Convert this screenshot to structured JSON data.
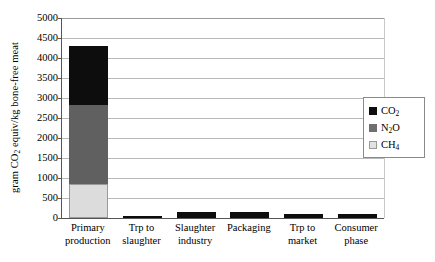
{
  "chart_data": {
    "type": "bar",
    "subtype": "stacked",
    "title": "",
    "xlabel": "",
    "ylabel": "gram CO2 equiv/kg bone-free meat",
    "ylabel_parts": {
      "pre": "gram CO",
      "sub": "2",
      "post": " equiv/kg bone-free meat"
    },
    "ylim": [
      0,
      5000
    ],
    "ytick_step": 500,
    "ytick_labels": [
      "0",
      "500",
      "1000",
      "1500",
      "2000",
      "2500",
      "3000",
      "3500",
      "4000",
      "4500",
      "5000"
    ],
    "ytick_values": [
      0,
      500,
      1000,
      1500,
      2000,
      2500,
      3000,
      3500,
      4000,
      4500,
      5000
    ],
    "grid": true,
    "grid_axis": "y",
    "legend_position": "right",
    "categories": [
      "Primary production",
      "Trp to slaughter",
      "Slaughter industry",
      "Packaging",
      "Trp to market",
      "Consumer phase"
    ],
    "category_lines": [
      [
        "Primary",
        "production"
      ],
      [
        "Trp to",
        "slaughter"
      ],
      [
        "Slaughter",
        "industry"
      ],
      [
        "Packaging",
        ""
      ],
      [
        "Trp to",
        "market"
      ],
      [
        "Consumer",
        "phase"
      ]
    ],
    "series": [
      {
        "name": "CH4",
        "name_parts": {
          "pre": "CH",
          "sub": "4"
        },
        "color": "#dcdcdc",
        "values": [
          850,
          0,
          0,
          0,
          0,
          0
        ]
      },
      {
        "name": "N2O",
        "name_parts": {
          "pre": "N",
          "sub": "2",
          "post": "O"
        },
        "color": "#606060",
        "values": [
          1980,
          0,
          0,
          0,
          0,
          0
        ]
      },
      {
        "name": "CO2",
        "name_parts": {
          "pre": "CO",
          "sub": "2"
        },
        "color": "#0d0d0d",
        "values": [
          1470,
          40,
          150,
          160,
          90,
          90
        ]
      }
    ],
    "totals": [
      4300,
      40,
      150,
      160,
      90,
      90
    ],
    "stack_boundaries": [
      850,
      2830,
      4300
    ]
  },
  "legend": {
    "entries": [
      {
        "label": "CO2",
        "pre": "CO",
        "sub": "2",
        "post": "",
        "color": "#0d0d0d"
      },
      {
        "label": "N2O",
        "pre": "N",
        "sub": "2",
        "post": "O",
        "color": "#6e6e6e"
      },
      {
        "label": "CH4",
        "pre": "CH",
        "sub": "4",
        "post": "",
        "color": "#e2e2e2"
      }
    ]
  }
}
